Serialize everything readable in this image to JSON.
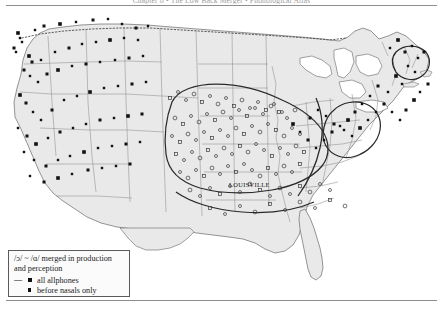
{
  "page": {
    "running_head": "Chapter 8  •  The Low Back Merger  •  Phonological Atlas",
    "width": 443,
    "height": 311,
    "background": "#ffffff"
  },
  "map": {
    "title": "",
    "region": "United States",
    "land_fill": "#e9e9e9",
    "land_stroke": "#7d7d7d",
    "state_stroke": "#8a8a8a",
    "isogloss_stroke": "#2a2a2a",
    "canada_border_stroke": "#4a4a4a",
    "canada_border_style": "dotted"
  },
  "city_labels": [
    {
      "name": "LOUISVILLE",
      "x": 229,
      "y": 181
    }
  ],
  "legend": {
    "title_line_1": "/ɔ/ ~ /ɑ/ merged in production",
    "title_line_2": "and perception",
    "items": [
      {
        "dash": "—",
        "marker": "filled-square",
        "label": "all allphones"
      },
      {
        "dash": "",
        "marker": "filled-square-small",
        "label": "before nasals only"
      }
    ]
  },
  "chart_data": {
    "type": "map",
    "title": "/ɔ/ ~ /ɑ/ merged in production and perception",
    "projection": "conic",
    "legend_position": "bottom-left",
    "series": [
      {
        "name": "all allphones",
        "marker": "filled-square",
        "color": "#111111",
        "description": "Western US, New England, Western Pennsylvania"
      },
      {
        "name": "before nasals only",
        "marker": "open-circle",
        "color": "#3a3a3a",
        "description": "Midland and Midwest"
      }
    ],
    "points_all_allphones": [
      [
        18,
        33
      ],
      [
        20,
        38
      ],
      [
        22,
        42
      ],
      [
        14,
        48
      ],
      [
        16,
        52
      ],
      [
        35,
        30
      ],
      [
        44,
        26
      ],
      [
        60,
        24
      ],
      [
        76,
        22
      ],
      [
        93,
        20
      ],
      [
        108,
        19
      ],
      [
        122,
        24
      ],
      [
        136,
        28
      ],
      [
        148,
        26
      ],
      [
        29,
        56
      ],
      [
        32,
        62
      ],
      [
        41,
        60
      ],
      [
        55,
        52
      ],
      [
        69,
        48
      ],
      [
        82,
        44
      ],
      [
        96,
        42
      ],
      [
        110,
        40
      ],
      [
        124,
        38
      ],
      [
        138,
        40
      ],
      [
        24,
        70
      ],
      [
        30,
        76
      ],
      [
        38,
        82
      ],
      [
        47,
        74
      ],
      [
        58,
        70
      ],
      [
        72,
        66
      ],
      [
        86,
        64
      ],
      [
        100,
        62
      ],
      [
        115,
        60
      ],
      [
        129,
        58
      ],
      [
        143,
        56
      ],
      [
        20,
        95
      ],
      [
        26,
        103
      ],
      [
        33,
        112
      ],
      [
        41,
        120
      ],
      [
        52,
        110
      ],
      [
        64,
        100
      ],
      [
        77,
        96
      ],
      [
        90,
        92
      ],
      [
        104,
        88
      ],
      [
        118,
        86
      ],
      [
        132,
        84
      ],
      [
        146,
        82
      ],
      [
        18,
        128
      ],
      [
        27,
        136
      ],
      [
        36,
        144
      ],
      [
        48,
        138
      ],
      [
        60,
        132
      ],
      [
        73,
        128
      ],
      [
        86,
        124
      ],
      [
        100,
        120
      ],
      [
        114,
        118
      ],
      [
        128,
        116
      ],
      [
        142,
        114
      ],
      [
        24,
        152
      ],
      [
        34,
        160
      ],
      [
        46,
        166
      ],
      [
        58,
        160
      ],
      [
        70,
        156
      ],
      [
        84,
        152
      ],
      [
        98,
        148
      ],
      [
        112,
        146
      ],
      [
        126,
        144
      ],
      [
        140,
        142
      ],
      [
        30,
        176
      ],
      [
        44,
        182
      ],
      [
        58,
        178
      ],
      [
        72,
        174
      ],
      [
        88,
        170
      ],
      [
        102,
        168
      ],
      [
        116,
        166
      ],
      [
        130,
        164
      ],
      [
        390,
        48
      ],
      [
        398,
        40
      ],
      [
        405,
        52
      ],
      [
        412,
        46
      ],
      [
        418,
        58
      ],
      [
        424,
        52
      ],
      [
        408,
        66
      ],
      [
        415,
        72
      ],
      [
        396,
        76
      ],
      [
        402,
        84
      ],
      [
        388,
        92
      ],
      [
        378,
        86
      ],
      [
        370,
        96
      ],
      [
        362,
        104
      ],
      [
        355,
        112
      ],
      [
        348,
        120
      ],
      [
        340,
        126
      ],
      [
        332,
        132
      ],
      [
        324,
        140
      ],
      [
        316,
        148
      ],
      [
        308,
        140
      ],
      [
        300,
        132
      ],
      [
        293,
        124
      ],
      [
        310,
        118
      ],
      [
        318,
        110
      ],
      [
        326,
        116
      ],
      [
        334,
        124
      ],
      [
        344,
        130
      ],
      [
        352,
        136
      ],
      [
        360,
        128
      ],
      [
        368,
        120
      ],
      [
        376,
        112
      ],
      [
        384,
        104
      ],
      [
        392,
        112
      ],
      [
        400,
        120
      ],
      [
        406,
        110
      ],
      [
        414,
        100
      ],
      [
        420,
        92
      ],
      [
        428,
        84
      ]
    ],
    "points_before_nasals": [
      [
        170,
        98
      ],
      [
        178,
        92
      ],
      [
        186,
        100
      ],
      [
        194,
        94
      ],
      [
        202,
        102
      ],
      [
        210,
        96
      ],
      [
        218,
        104
      ],
      [
        226,
        98
      ],
      [
        234,
        106
      ],
      [
        242,
        100
      ],
      [
        250,
        108
      ],
      [
        258,
        102
      ],
      [
        266,
        110
      ],
      [
        274,
        104
      ],
      [
        282,
        112
      ],
      [
        175,
        118
      ],
      [
        183,
        124
      ],
      [
        191,
        116
      ],
      [
        199,
        122
      ],
      [
        207,
        114
      ],
      [
        215,
        120
      ],
      [
        223,
        112
      ],
      [
        231,
        118
      ],
      [
        239,
        110
      ],
      [
        247,
        116
      ],
      [
        255,
        108
      ],
      [
        263,
        114
      ],
      [
        271,
        106
      ],
      [
        279,
        112
      ],
      [
        287,
        118
      ],
      [
        295,
        110
      ],
      [
        172,
        136
      ],
      [
        180,
        142
      ],
      [
        188,
        134
      ],
      [
        196,
        140
      ],
      [
        204,
        132
      ],
      [
        212,
        138
      ],
      [
        220,
        130
      ],
      [
        228,
        136
      ],
      [
        236,
        128
      ],
      [
        244,
        134
      ],
      [
        252,
        126
      ],
      [
        260,
        132
      ],
      [
        268,
        124
      ],
      [
        276,
        130
      ],
      [
        284,
        136
      ],
      [
        292,
        128
      ],
      [
        300,
        134
      ],
      [
        176,
        154
      ],
      [
        184,
        160
      ],
      [
        192,
        152
      ],
      [
        200,
        158
      ],
      [
        208,
        150
      ],
      [
        216,
        156
      ],
      [
        224,
        148
      ],
      [
        232,
        154
      ],
      [
        240,
        146
      ],
      [
        248,
        152
      ],
      [
        256,
        144
      ],
      [
        264,
        150
      ],
      [
        272,
        156
      ],
      [
        280,
        148
      ],
      [
        288,
        154
      ],
      [
        296,
        146
      ],
      [
        304,
        152
      ],
      [
        180,
        172
      ],
      [
        188,
        178
      ],
      [
        196,
        170
      ],
      [
        204,
        176
      ],
      [
        212,
        168
      ],
      [
        220,
        174
      ],
      [
        228,
        166
      ],
      [
        236,
        172
      ],
      [
        244,
        164
      ],
      [
        252,
        170
      ],
      [
        260,
        176
      ],
      [
        268,
        168
      ],
      [
        276,
        174
      ],
      [
        284,
        166
      ],
      [
        292,
        172
      ],
      [
        300,
        164
      ],
      [
        190,
        190
      ],
      [
        200,
        196
      ],
      [
        210,
        188
      ],
      [
        220,
        194
      ],
      [
        230,
        186
      ],
      [
        240,
        192
      ],
      [
        250,
        184
      ],
      [
        260,
        190
      ],
      [
        270,
        196
      ],
      [
        280,
        188
      ],
      [
        290,
        194
      ],
      [
        300,
        186
      ],
      [
        310,
        192
      ],
      [
        320,
        184
      ],
      [
        330,
        190
      ],
      [
        210,
        208
      ],
      [
        225,
        214
      ],
      [
        240,
        206
      ],
      [
        255,
        212
      ],
      [
        270,
        204
      ],
      [
        285,
        210
      ],
      [
        300,
        202
      ],
      [
        315,
        208
      ],
      [
        330,
        200
      ],
      [
        345,
        206
      ]
    ]
  }
}
